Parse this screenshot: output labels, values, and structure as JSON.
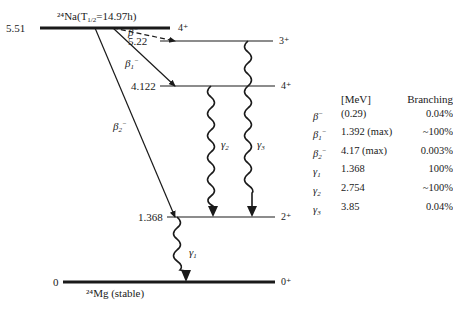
{
  "parent": {
    "nuclide": "²⁴Na",
    "half_life_label": "(T",
    "half_life_sub": "1/2",
    "half_life_value": "=14.97h)",
    "energy": "5.51",
    "spin": "4⁺"
  },
  "levels": [
    {
      "energy": "5.22",
      "spin": "3⁺"
    },
    {
      "energy": "4.122",
      "spin": "4⁺"
    },
    {
      "energy": "1.368",
      "spin": "2⁺"
    },
    {
      "energy": "0",
      "spin": "0⁺"
    }
  ],
  "daughter": {
    "label": "²⁴Mg (stable)"
  },
  "transitions": {
    "beta": "β",
    "beta1": "β",
    "beta2": "β",
    "gamma1": "γ",
    "gamma2": "γ",
    "gamma3": "γ"
  },
  "table": {
    "header_energy": "[MeV]",
    "header_branching": "Branching",
    "rows": [
      {
        "sym": "β",
        "sub": "",
        "sup": "−",
        "energy": "(0.29)",
        "branching": "0.04%"
      },
      {
        "sym": "β",
        "sub": "1",
        "sup": "−",
        "energy": "1.392 (max)",
        "branching": "~100%"
      },
      {
        "sym": "β",
        "sub": "2",
        "sup": "−",
        "energy": "4.17 (max)",
        "branching": "0.003%"
      },
      {
        "sym": "γ",
        "sub": "1",
        "sup": "",
        "energy": "1.368",
        "branching": "100%"
      },
      {
        "sym": "γ",
        "sub": "2",
        "sup": "",
        "energy": "2.754",
        "branching": "~100%"
      },
      {
        "sym": "γ",
        "sub": "3",
        "sup": "",
        "energy": "3.85",
        "branching": "0.04%"
      }
    ]
  }
}
